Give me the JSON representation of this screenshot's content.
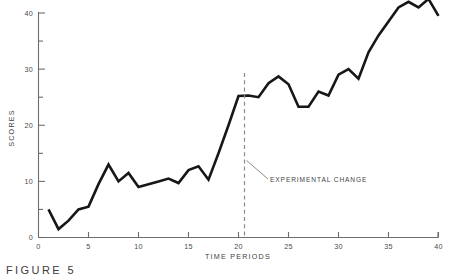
{
  "figure": {
    "caption": "FIGURE 5"
  },
  "axes": {
    "x_title": "TIME  PERIODS",
    "y_title": "SCORES",
    "x_ticks_major": [
      0,
      5,
      10,
      15,
      20,
      25,
      30,
      35,
      40
    ],
    "x_ticks_minor": [],
    "y_ticks_major": [
      0,
      10,
      20,
      30,
      40
    ],
    "y_ticks_minor": [
      5,
      15,
      25,
      35
    ],
    "axis_color": "#6d6d6d",
    "label_color": "#4a4a4a"
  },
  "annotation": {
    "label": "EXPERIMENTAL CHANGE",
    "line_color": "#8a8a8a",
    "at_time": 20.6
  },
  "chart_data": {
    "type": "line",
    "title": "",
    "subtitle": "",
    "xlabel": "TIME  PERIODS",
    "ylabel": "SCORES",
    "xlim": [
      0,
      40
    ],
    "ylim": [
      0,
      42
    ],
    "grid": false,
    "legend": "none",
    "line_color": "#171717",
    "x": [
      1,
      2,
      3,
      4,
      5,
      6,
      7,
      8,
      9,
      10,
      11,
      12,
      13,
      14,
      15,
      16,
      17,
      18,
      19,
      20,
      21,
      22,
      23,
      24,
      25,
      26,
      27,
      28,
      29,
      30,
      31,
      32,
      33,
      34,
      35,
      36,
      37,
      38,
      39,
      40
    ],
    "values": [
      5,
      1.5,
      3,
      5,
      5.5,
      9.5,
      13,
      10,
      11.5,
      9,
      9.5,
      10,
      10.5,
      9.7,
      12,
      12.7,
      10.3,
      15,
      20,
      25.2,
      25.3,
      25,
      27.5,
      28.7,
      27.3,
      23.3,
      23.3,
      26,
      25.3,
      29,
      30,
      28.3,
      33,
      36,
      38.5,
      41,
      42,
      41,
      42.5,
      39.5
    ],
    "series": [
      {
        "name": "scores",
        "values": [
          5,
          1.5,
          3,
          5,
          5.5,
          9.5,
          13,
          10,
          11.5,
          9,
          9.5,
          10,
          10.5,
          9.7,
          12,
          12.7,
          10.3,
          15,
          20,
          25.2,
          25.3,
          25,
          27.5,
          28.7,
          27.3,
          23.3,
          23.3,
          26,
          25.3,
          29,
          30,
          28.3,
          33,
          36,
          38.5,
          41,
          42,
          41,
          42.5,
          39.5
        ]
      }
    ],
    "annotations": [
      {
        "text": "EXPERIMENTAL CHANGE",
        "x": 20.6,
        "type": "vertical-dashed-line"
      }
    ]
  }
}
